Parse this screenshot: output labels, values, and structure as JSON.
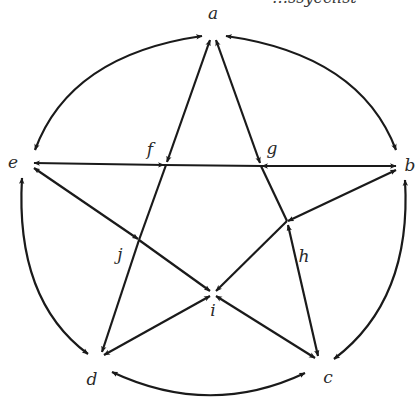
{
  "diagram": {
    "type": "directed-graph",
    "colors": {
      "stroke": "#1a1a1a",
      "label": "#2a2a2a",
      "background": "#ffffff"
    },
    "cropped_header_text": "…ssyeclist",
    "nodes": [
      {
        "id": "a",
        "label": "a",
        "x": 213,
        "y": 38,
        "lx": 213,
        "ly": 19
      },
      {
        "id": "b",
        "label": "b",
        "x": 400,
        "y": 165,
        "lx": 410,
        "ly": 171
      },
      {
        "id": "c",
        "label": "c",
        "x": 318,
        "y": 360,
        "lx": 328,
        "ly": 383
      },
      {
        "id": "d",
        "label": "d",
        "x": 100,
        "y": 357,
        "lx": 92,
        "ly": 385
      },
      {
        "id": "e",
        "label": "e",
        "x": 30,
        "y": 163,
        "lx": 13,
        "ly": 168
      },
      {
        "id": "f",
        "label": "f",
        "x": 166,
        "y": 165,
        "lx": 150,
        "ly": 155
      },
      {
        "id": "g",
        "label": "g",
        "x": 261,
        "y": 166,
        "lx": 272,
        "ly": 154
      },
      {
        "id": "h",
        "label": "h",
        "x": 287,
        "y": 221,
        "lx": 304,
        "ly": 262
      },
      {
        "id": "i",
        "label": "i",
        "x": 213,
        "y": 293,
        "lx": 213,
        "ly": 316
      },
      {
        "id": "j",
        "label": "j",
        "x": 139,
        "y": 240,
        "lx": 120,
        "ly": 260
      }
    ],
    "arcs": [
      {
        "from": "a",
        "to": "e",
        "arrows": "both"
      },
      {
        "from": "a",
        "to": "b",
        "arrows": "both"
      },
      {
        "from": "e",
        "to": "d",
        "arrows": "both"
      },
      {
        "from": "b",
        "to": "c",
        "arrows": "both"
      },
      {
        "from": "d",
        "to": "c",
        "arrows": "both"
      }
    ],
    "edges": [
      {
        "from": "e",
        "to": "f"
      },
      {
        "from": "f",
        "to": "e"
      },
      {
        "from": "b",
        "to": "g"
      },
      {
        "from": "g",
        "to": "b"
      },
      {
        "from": "f",
        "to": "g",
        "arrows": "none"
      },
      {
        "from": "a",
        "to": "f"
      },
      {
        "from": "f",
        "to": "a"
      },
      {
        "from": "a",
        "to": "g"
      },
      {
        "from": "g",
        "to": "a"
      },
      {
        "from": "f",
        "to": "j",
        "arrows": "none"
      },
      {
        "from": "j",
        "to": "d"
      },
      {
        "from": "g",
        "to": "h",
        "arrows": "none"
      },
      {
        "from": "c",
        "to": "h"
      },
      {
        "from": "h",
        "to": "c"
      },
      {
        "from": "e",
        "to": "j"
      },
      {
        "from": "j",
        "to": "e"
      },
      {
        "from": "j",
        "to": "i"
      },
      {
        "from": "i",
        "to": "c"
      },
      {
        "from": "c",
        "to": "i"
      },
      {
        "from": "b",
        "to": "h"
      },
      {
        "from": "h",
        "to": "b"
      },
      {
        "from": "h",
        "to": "i"
      },
      {
        "from": "i",
        "to": "d"
      },
      {
        "from": "d",
        "to": "i"
      }
    ]
  }
}
